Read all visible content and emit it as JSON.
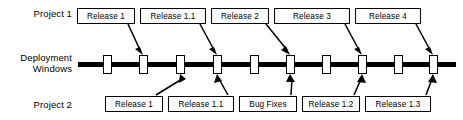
{
  "diagram": {
    "colors": {
      "line": "#000000",
      "box_fill": "#ffffff",
      "box_border": "#000000",
      "background": "#ffffff"
    },
    "rows": {
      "project1_label": "Project 1",
      "deployment_label": "Deployment\nWindows",
      "project2_label": "Project 2"
    },
    "project1_releases": [
      {
        "label": "Release 1",
        "x": 77,
        "width": 58,
        "target_marker": 1
      },
      {
        "label": "Release 1.1",
        "x": 140,
        "width": 66,
        "target_marker": 3
      },
      {
        "label": "Release 2",
        "x": 211,
        "width": 58,
        "target_marker": 5
      },
      {
        "label": "Release 3",
        "x": 274,
        "width": 76,
        "target_marker": 7
      },
      {
        "label": "Release 4",
        "x": 355,
        "width": 66,
        "target_marker": 9
      }
    ],
    "project2_releases": [
      {
        "label": "Release 1",
        "x": 105,
        "width": 58,
        "target_marker": 2
      },
      {
        "label": "Release 1.1",
        "x": 168,
        "width": 66,
        "target_marker": 4
      },
      {
        "label": "Bug Fixes",
        "x": 239,
        "width": 58,
        "target_marker": 6
      },
      {
        "label": "Release 1.2",
        "x": 302,
        "width": 58,
        "target_marker": 7
      },
      {
        "label": "Release 1.3",
        "x": 365,
        "width": 66,
        "target_marker": 9
      }
    ],
    "deployment_windows": [
      {
        "index": 0,
        "x": 107
      },
      {
        "index": 1,
        "x": 143
      },
      {
        "index": 2,
        "x": 180
      },
      {
        "index": 3,
        "x": 217
      },
      {
        "index": 4,
        "x": 254
      },
      {
        "index": 5,
        "x": 290
      },
      {
        "index": 6,
        "x": 326
      },
      {
        "index": 7,
        "x": 362
      },
      {
        "index": 8,
        "x": 398
      },
      {
        "index": 9,
        "x": 433
      }
    ],
    "timeline": {
      "x": 78,
      "width": 378,
      "y": 62,
      "thickness": 5
    }
  }
}
